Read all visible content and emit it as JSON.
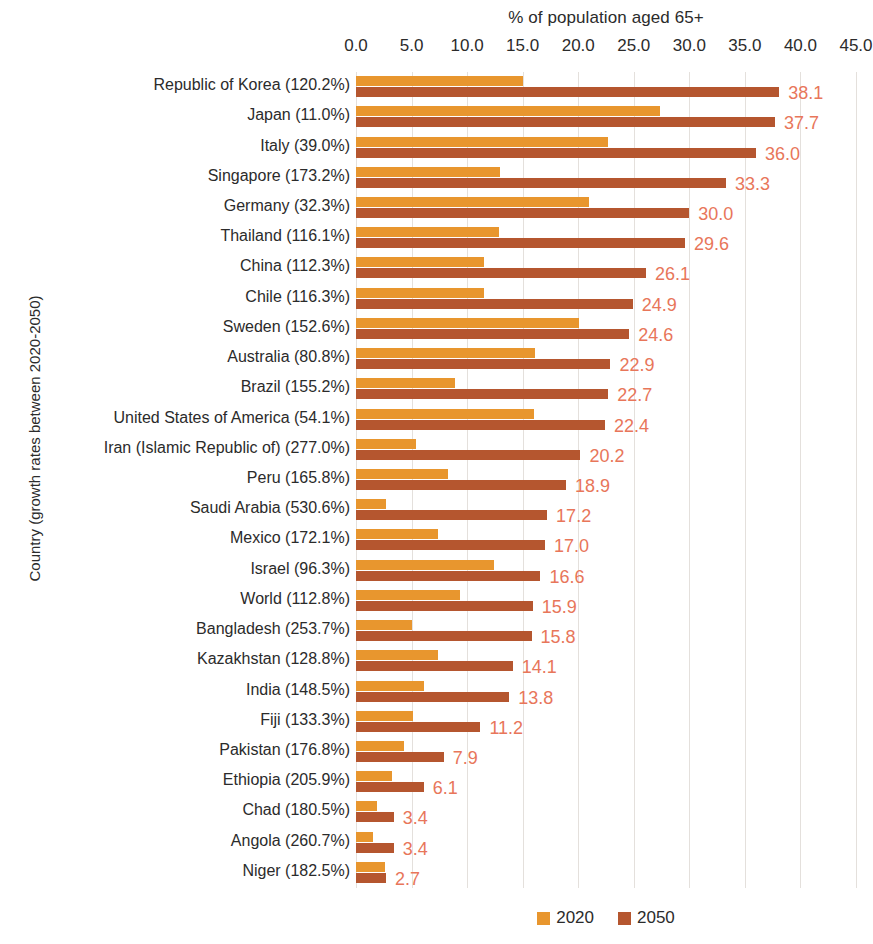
{
  "chart_data": {
    "type": "bar",
    "orientation": "horizontal",
    "title": "% of population aged 65+",
    "xlabel": "% of population aged 65+",
    "ylabel": "Country (growth rates between 2020-2050)",
    "xlim": [
      0.0,
      45.0
    ],
    "xticks": [
      "0.0",
      "5.0",
      "10.0",
      "15.0",
      "20.0",
      "25.0",
      "30.0",
      "35.0",
      "40.0",
      "45.0"
    ],
    "xtick_values": [
      0,
      5,
      10,
      15,
      20,
      25,
      30,
      35,
      40,
      45
    ],
    "grid": true,
    "grid_axis": "x",
    "legend_position": "bottom",
    "data_labels_series": "2050",
    "categories": [
      "Republic of Korea (120.2%)",
      "Japan (11.0%)",
      "Italy (39.0%)",
      "Singapore (173.2%)",
      "Germany (32.3%)",
      "Thailand (116.1%)",
      "China (112.3%)",
      "Chile (116.3%)",
      "Sweden (152.6%)",
      "Australia (80.8%)",
      "Brazil (155.2%)",
      "United States of America (54.1%)",
      "Iran (Islamic Republic of) (277.0%)",
      "Peru (165.8%)",
      "Saudi Arabia (530.6%)",
      "Mexico (172.1%)",
      "Israel (96.3%)",
      "World (112.8%)",
      "Bangladesh (253.7%)",
      "Kazakhstan (128.8%)",
      "India (148.5%)",
      "Fiji (133.3%)",
      "Pakistan (176.8%)",
      "Ethiopia (205.9%)",
      "Chad (180.5%)",
      "Angola (260.7%)",
      "Niger (182.5%)"
    ],
    "series": [
      {
        "name": "2020",
        "color": "#E8962E",
        "values": [
          15.0,
          27.4,
          22.7,
          13.0,
          21.0,
          12.9,
          11.5,
          11.5,
          20.1,
          16.1,
          8.9,
          16.0,
          5.4,
          8.3,
          2.7,
          7.4,
          12.4,
          9.4,
          5.0,
          7.4,
          6.1,
          5.1,
          4.3,
          3.2,
          1.9,
          1.5,
          2.6
        ]
      },
      {
        "name": "2050",
        "color": "#B5562F",
        "values": [
          38.1,
          37.7,
          36.0,
          33.3,
          30.0,
          29.6,
          26.1,
          24.9,
          24.6,
          22.9,
          22.7,
          22.4,
          20.2,
          18.9,
          17.2,
          17.0,
          16.6,
          15.9,
          15.8,
          14.1,
          13.8,
          11.2,
          7.9,
          6.1,
          3.4,
          3.4,
          2.7
        ]
      }
    ],
    "data_labels": [
      "38.1",
      "37.7",
      "36.0",
      "33.3",
      "30.0",
      "29.6",
      "26.1",
      "24.9",
      "24.6",
      "22.9",
      "22.7",
      "22.4",
      "20.2",
      "18.9",
      "17.2",
      "17.0",
      "16.6",
      "15.9",
      "15.8",
      "14.1",
      "13.8",
      "11.2",
      "7.9",
      "6.1",
      "3.4",
      "3.4",
      "2.7"
    ],
    "label_color": "#E8765A"
  },
  "legend": {
    "items": [
      {
        "label": "2020",
        "color": "#E8962E"
      },
      {
        "label": "2050",
        "color": "#B5562F"
      }
    ]
  }
}
